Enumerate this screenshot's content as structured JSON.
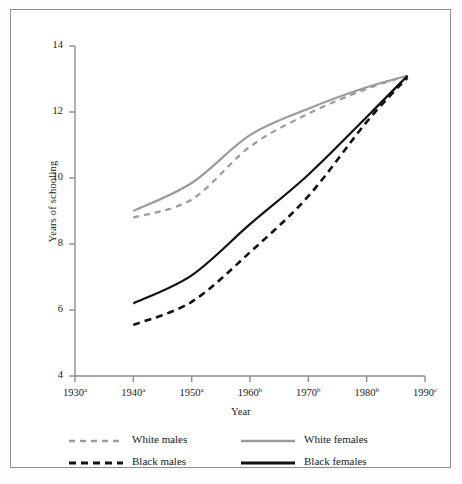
{
  "figure": {
    "background": "#ffffff",
    "border_color": "#8d8d92"
  },
  "chart_data": {
    "type": "line",
    "title": "",
    "xlabel": "Year",
    "ylabel": "Years of schooling",
    "xlim": [
      1930,
      1990
    ],
    "ylim": [
      4,
      14
    ],
    "grid": false,
    "legend_position": "below-axes",
    "xticks": [
      1930,
      1940,
      1950,
      1960,
      1970,
      1980,
      1990
    ],
    "xtick_labels": [
      "1930",
      "1940",
      "1950",
      "1960",
      "1970",
      "1980",
      "1990"
    ],
    "xtick_superscripts": [
      "a",
      "a",
      "a",
      "b",
      "b",
      "b",
      "c"
    ],
    "yticks": [
      4,
      6,
      8,
      10,
      12,
      14
    ],
    "ytick_labels": [
      "4",
      "6",
      "8",
      "10",
      "12",
      "14"
    ],
    "x": [
      1940,
      1950,
      1960,
      1970,
      1980,
      1987
    ],
    "series": [
      {
        "name": "White males",
        "color": "#9b9b9b",
        "style": "dashed",
        "width": 2.2,
        "values": [
          8.8,
          9.35,
          10.95,
          11.95,
          12.7,
          13.1
        ]
      },
      {
        "name": "White females",
        "color": "#9b9b9b",
        "style": "solid",
        "width": 2.2,
        "values": [
          9.0,
          9.85,
          11.3,
          12.1,
          12.75,
          13.1
        ]
      },
      {
        "name": "Black males",
        "color": "#111111",
        "style": "dashed",
        "width": 2.6,
        "values": [
          5.55,
          6.25,
          7.75,
          9.45,
          11.7,
          13.05
        ]
      },
      {
        "name": "Black females",
        "color": "#111111",
        "style": "solid",
        "width": 2.2,
        "values": [
          6.2,
          7.05,
          8.6,
          10.1,
          11.85,
          13.1
        ]
      }
    ]
  },
  "legend": {
    "entries": [
      {
        "label": "White males",
        "color": "#9b9b9b",
        "style": "dashed"
      },
      {
        "label": "White females",
        "color": "#9b9b9b",
        "style": "solid"
      },
      {
        "label": "Black males",
        "color": "#111111",
        "style": "dashed"
      },
      {
        "label": "Black females",
        "color": "#111111",
        "style": "solid"
      }
    ]
  }
}
